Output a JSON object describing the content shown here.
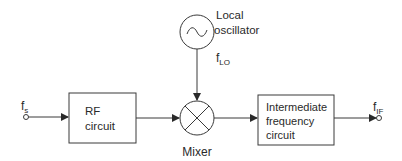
{
  "diagram": {
    "type": "superheterodyne-receiver-block-diagram",
    "colors": {
      "stroke": "#3a3a3a",
      "text": "#2a2a2a",
      "background": "#ffffff"
    },
    "input": {
      "label": "f",
      "subscript": "s",
      "icon": "terminal-circle-icon"
    },
    "rf_block": {
      "line1": "RF",
      "line2": "circuit"
    },
    "mixer": {
      "label": "Mixer",
      "icon": "multiplier-cross-circle-icon"
    },
    "local_oscillator": {
      "line1": "Local",
      "line2": "oscillator",
      "icon": "sine-wave-source-icon",
      "freq_label": "f",
      "freq_subscript": "LO"
    },
    "if_block": {
      "line1": "Intermediate",
      "line2": "frequency",
      "line3": "circuit"
    },
    "output": {
      "label": "f",
      "subscript": "IF",
      "icon": "terminal-circle-icon"
    }
  }
}
